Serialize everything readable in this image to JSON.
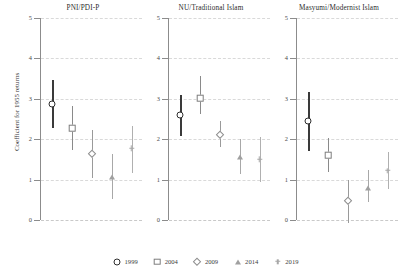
{
  "figure": {
    "ylabel": "Coefficient for 1955 returns",
    "yticks": [
      "0",
      "1",
      "2",
      "3",
      "4",
      "5"
    ]
  },
  "legend": {
    "items": [
      {
        "label": "1999",
        "marker": "circle",
        "color": "#2e2e2e"
      },
      {
        "label": "2004",
        "marker": "square",
        "color": "#7d7d7d"
      },
      {
        "label": "2009",
        "marker": "diamond",
        "color": "#8d8d8d"
      },
      {
        "label": "2014",
        "marker": "triangle",
        "color": "#a0a0a0"
      },
      {
        "label": "2019",
        "marker": "plus",
        "color": "#a8a8a8"
      }
    ]
  },
  "chart_data": {
    "type": "scatter",
    "title": "",
    "xlabel": "",
    "ylabel": "Coefficient for 1955 returns",
    "ylim": [
      0,
      5
    ],
    "yticks": [
      0,
      1,
      2,
      3,
      4,
      5
    ],
    "grid": true,
    "legend_position": "bottom",
    "categories": [
      "1999",
      "2004",
      "2009",
      "2014",
      "2019"
    ],
    "panels": [
      {
        "title": "PNI/PDI-P",
        "points": [
          {
            "year": "1999",
            "estimate": 2.88,
            "ci_low": 2.27,
            "ci_high": 3.47
          },
          {
            "year": "2004",
            "estimate": 2.27,
            "ci_low": 1.74,
            "ci_high": 2.82
          },
          {
            "year": "2009",
            "estimate": 1.63,
            "ci_low": 1.03,
            "ci_high": 2.24
          },
          {
            "year": "2014",
            "estimate": 1.07,
            "ci_low": 0.53,
            "ci_high": 1.63
          },
          {
            "year": "2019",
            "estimate": 1.77,
            "ci_low": 1.17,
            "ci_high": 2.33
          }
        ]
      },
      {
        "title": "NU/Traditional Islam",
        "points": [
          {
            "year": "1999",
            "estimate": 2.59,
            "ci_low": 2.09,
            "ci_high": 3.09
          },
          {
            "year": "2004",
            "estimate": 3.02,
            "ci_low": 2.63,
            "ci_high": 3.56
          },
          {
            "year": "2009",
            "estimate": 2.11,
            "ci_low": 1.8,
            "ci_high": 2.45
          },
          {
            "year": "2014",
            "estimate": 1.55,
            "ci_low": 1.15,
            "ci_high": 2.0
          },
          {
            "year": "2019",
            "estimate": 1.5,
            "ci_low": 0.95,
            "ci_high": 2.05
          }
        ]
      },
      {
        "title": "Masyumi/Modernist Islam",
        "points": [
          {
            "year": "1999",
            "estimate": 2.44,
            "ci_low": 1.71,
            "ci_high": 3.16
          },
          {
            "year": "2004",
            "estimate": 1.61,
            "ci_low": 1.18,
            "ci_high": 2.04
          },
          {
            "year": "2009",
            "estimate": 0.46,
            "ci_low": -0.08,
            "ci_high": 0.98
          },
          {
            "year": "2014",
            "estimate": 0.8,
            "ci_low": 0.45,
            "ci_high": 1.23
          },
          {
            "year": "2019",
            "estimate": 1.22,
            "ci_low": 0.77,
            "ci_high": 1.68
          }
        ]
      }
    ]
  }
}
